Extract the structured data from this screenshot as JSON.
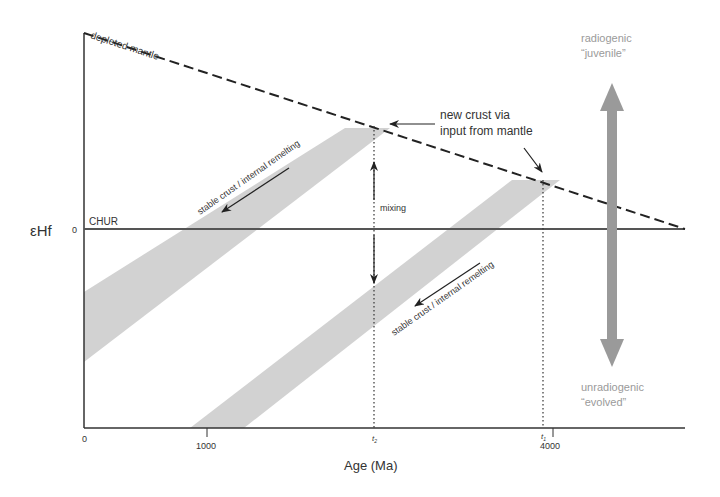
{
  "diagram": {
    "y_axis_label": "εHf",
    "y_zero_label": "0",
    "x_axis_label": "Age (Ma)",
    "x_ticks": [
      {
        "label": "0",
        "value": 0
      },
      {
        "label": "1000",
        "value": 1000
      },
      {
        "label": "4000",
        "value": 4000
      }
    ],
    "time_markers": {
      "t2": "t",
      "t2_sub": "2",
      "t1": "t",
      "t1_sub": "1"
    },
    "lines": {
      "depleted_mantle": "depleted mantle",
      "chur": "CHUR"
    },
    "annotations": {
      "new_crust_line1": "new crust via",
      "new_crust_line2": "input from mantle",
      "mixing": "mixing",
      "band_upper": "stable crust / internal remelting",
      "band_lower": "stable crust / internal remelting"
    },
    "scale": {
      "top_line1": "radiogenic",
      "top_line2": "“juvenile”",
      "bottom_line1": "unradiogenic",
      "bottom_line2": "“evolved”"
    },
    "colors": {
      "axis": "#333333",
      "band": "#cfcfcf",
      "scale_arrow": "#9a9a9a",
      "scale_text": "#9a9a9a"
    }
  }
}
